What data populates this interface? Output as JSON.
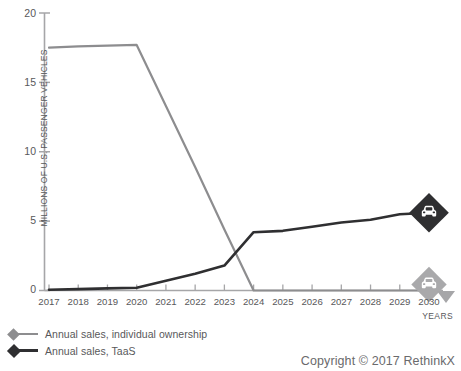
{
  "chart_data": {
    "type": "line",
    "title": "",
    "subtitle": "",
    "xlabel": "YEARS",
    "ylabel": "MILLIONS OF U.S. PASSENGER VEHICLES",
    "x": [
      2017,
      2018,
      2019,
      2020,
      2021,
      2022,
      2023,
      2024,
      2025,
      2026,
      2027,
      2028,
      2029,
      2030
    ],
    "categories": [
      "2017",
      "2018",
      "2019",
      "2020",
      "2021",
      "2022",
      "2023",
      "2024",
      "2025",
      "2026",
      "2027",
      "2028",
      "2029",
      "2030"
    ],
    "xlim": [
      2017,
      2030
    ],
    "ylim": [
      0,
      20
    ],
    "yticks": [
      "0",
      "5",
      "10",
      "15",
      "20"
    ],
    "ytick_values": [
      0,
      5,
      10,
      15,
      20
    ],
    "grid": false,
    "legend_position": "below-left",
    "series": [
      {
        "name": "Annual sales, individual ownership",
        "color": "#8d8d8f",
        "marker": "diamond",
        "values": [
          17.5,
          17.6,
          17.65,
          17.7,
          13.3,
          8.9,
          4.4,
          0.0,
          0.0,
          0.0,
          0.0,
          0.0,
          0.0,
          0.0
        ]
      },
      {
        "name": "Annual sales, TaaS",
        "color": "#2f2f31",
        "marker": "diamond",
        "values": [
          0.05,
          0.1,
          0.15,
          0.2,
          0.7,
          1.2,
          1.8,
          4.2,
          4.3,
          4.6,
          4.9,
          5.1,
          5.5,
          5.6
        ]
      }
    ],
    "annotations": [
      {
        "name": "taas-endpoint-badge",
        "icon": "car-icon",
        "style": "dark-diamond",
        "x": 2030,
        "y": 5.6
      },
      {
        "name": "individual-endpoint-badge",
        "icon": "car-icon",
        "style": "light-diamond",
        "x": 2030,
        "y": 0.0
      }
    ]
  },
  "legend": {
    "items": [
      {
        "label": "Annual sales, individual ownership",
        "color": "#8d8d8f"
      },
      {
        "label": "Annual sales, TaaS",
        "color": "#2f2f31"
      }
    ]
  },
  "footer": {
    "copyright": "Copyright © 2017 RethinkX"
  },
  "colors": {
    "individual": "#8d8d8f",
    "taas": "#2f2f31",
    "axis": "#a6a6a8",
    "text": "#58585a",
    "background": "#ffffff"
  }
}
